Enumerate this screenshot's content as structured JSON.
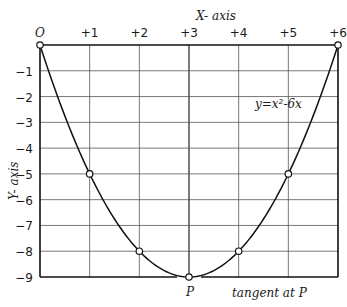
{
  "chart_data": {
    "type": "line",
    "title": "",
    "equation": "y=x²-6x",
    "xlabel": "X- axis",
    "ylabel": "Y- axis",
    "xlim": [
      0,
      6
    ],
    "ylim": [
      -9,
      0
    ],
    "grid": true,
    "x_ticks": [
      "0",
      "+1",
      "+2",
      "+3",
      "+4",
      "+5",
      "+6"
    ],
    "y_ticks": [
      "-1",
      "-2",
      "-3",
      "-4",
      "-5",
      "-6",
      "-7",
      "-8",
      "-9"
    ],
    "series": [
      {
        "name": "y=x²-6x",
        "x": [
          0,
          1,
          2,
          3,
          4,
          5,
          6
        ],
        "y": [
          0,
          -5,
          -8,
          -9,
          -8,
          -5,
          0
        ],
        "marked_points": [
          [
            0,
            0
          ],
          [
            1,
            -5
          ],
          [
            2,
            -8
          ],
          [
            3,
            -9
          ],
          [
            4,
            -8
          ],
          [
            5,
            -5
          ],
          [
            6,
            0
          ]
        ]
      }
    ],
    "annotations": [
      {
        "text": "P",
        "x": 3,
        "y": -9,
        "note": "vertex"
      },
      {
        "text": "tangent at P",
        "note": "horizontal line y=-9 along bottom"
      }
    ]
  },
  "labels": {
    "x_axis": "X- axis",
    "y_axis": "Y- axis",
    "equation": "y=x²-6x",
    "point_p": "P",
    "tangent": "tangent at P"
  }
}
